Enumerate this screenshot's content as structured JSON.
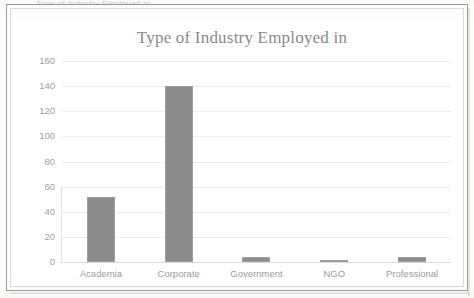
{
  "scan": {
    "clipped_top_text": "Type of Industry Employed in"
  },
  "chart_data": {
    "type": "bar",
    "title": "Type of Industry Employed in",
    "xlabel": "",
    "ylabel": "",
    "categories": [
      "Academia",
      "Corporate",
      "Government",
      "NGO",
      "Professional"
    ],
    "values": [
      52,
      140,
      4,
      1,
      4
    ],
    "ylim": [
      0,
      160
    ],
    "ytick_step": 20,
    "yticks": [
      "160",
      "140",
      "120",
      "100",
      "80",
      "60",
      "40",
      "20",
      "0"
    ],
    "grid": true,
    "legend": false,
    "bar_color": "#8c8c8c",
    "title_color": "#8a8a8a",
    "axis_text_color": "#a0a0a0",
    "gridline_color": "#ededed",
    "background_color": "#ffffff",
    "frame_color": "#9a9a9a"
  }
}
